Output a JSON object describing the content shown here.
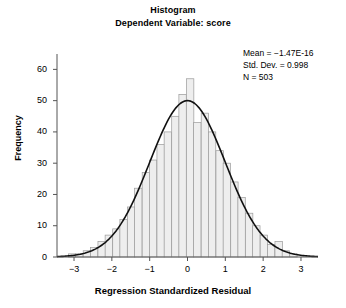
{
  "chart_data": {
    "type": "bar",
    "title": "Histogram",
    "subtitle": "Dependent Variable: score",
    "xlabel": "Regression Standardized Residual",
    "ylabel": "Frequency",
    "xlim": [
      -3.45,
      3.45
    ],
    "ylim": [
      0,
      63
    ],
    "xticks": [
      -3,
      -2,
      -1,
      0,
      1,
      2,
      3
    ],
    "xtick_labels": [
      "−3",
      "−2",
      "−1",
      "0",
      "1",
      "2",
      "3"
    ],
    "yticks": [
      0,
      10,
      20,
      30,
      40,
      50,
      60
    ],
    "ytick_labels": [
      "0",
      "10",
      "20",
      "30",
      "40",
      "50",
      "60"
    ],
    "grid": false,
    "legend": "none",
    "bar_color": "#eeeeee",
    "bar_edge_color": "#9a9a9a",
    "curve_color": "#111111",
    "bin_width": 0.195,
    "bin_centers": [
      -3.05,
      -2.86,
      -2.66,
      -2.47,
      -2.27,
      -2.08,
      -1.88,
      -1.69,
      -1.49,
      -1.3,
      -1.1,
      -0.91,
      -0.71,
      -0.52,
      -0.32,
      -0.13,
      0.07,
      0.26,
      0.46,
      0.65,
      0.85,
      1.04,
      1.24,
      1.43,
      1.63,
      1.82,
      2.02,
      2.21,
      2.41,
      2.6,
      2.8
    ],
    "values": [
      1,
      1,
      2,
      3,
      5,
      7,
      9,
      12,
      16,
      22,
      27,
      31,
      36,
      40,
      45,
      52,
      57,
      43,
      46,
      40,
      34,
      30,
      24,
      19,
      14,
      10,
      7,
      4,
      5,
      2,
      1
    ],
    "normal_curve": {
      "mean": 0,
      "sd": 0.998,
      "peak_value": 50,
      "n_points": 181
    },
    "annotations": {
      "mean_label": "Mean = −1.47E-16",
      "std_dev_label": "Std. Dev. = 0.998",
      "n_label": "N = 503"
    },
    "statistics": {
      "mean": "-1.47E-16",
      "std_dev": 0.998,
      "n": 503
    }
  },
  "axes": {
    "spine_color": "#555555"
  }
}
